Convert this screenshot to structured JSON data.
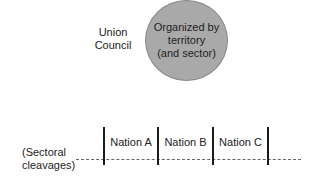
{
  "union_council": {
    "line1": "Union",
    "line2": "Council"
  },
  "circle": {
    "line1": "Organized by",
    "line2": "territory",
    "line3": "(and sector)",
    "fill": "#a9a9a9"
  },
  "cleavages": {
    "line1": "(Sectoral",
    "line2": "cleavages)"
  },
  "nations": [
    {
      "label": "Nation A"
    },
    {
      "label": "Nation B"
    },
    {
      "label": "Nation C"
    }
  ]
}
